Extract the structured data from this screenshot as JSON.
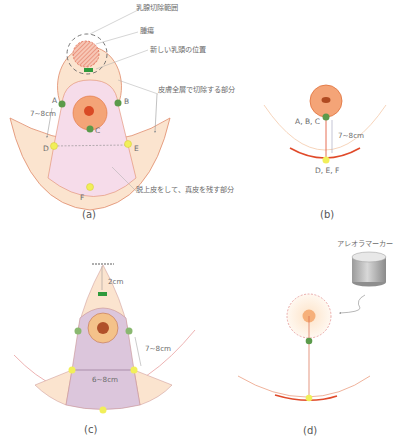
{
  "colors": {
    "skin": "#fbe4cf",
    "skin_stroke": "#e08a6a",
    "pink_region": "#f6dcea",
    "purple_region": "#dcc6dc",
    "areola": "#f4a477",
    "nipple": "#d94a25",
    "green_point": "#5b9a4a",
    "yellow_point": "#f1ef5a",
    "new_nipple_mark": "#2e9a3c",
    "red_line": "#e04a2a",
    "leader_line": "#aaaaaa"
  },
  "panel_a": {
    "caption": "(a)",
    "labels": {
      "mastectomy_range": "乳腺切除範囲",
      "tumor": "腫瘍",
      "new_nipple_position": "新しい乳頭の位置",
      "full_thickness_excision": "皮膚全層で切除する部分",
      "deepithelialized": "脱上皮をして、真皮を残す部分"
    },
    "points": {
      "A": "A",
      "B": "B",
      "C": "C",
      "D": "D",
      "E": "E",
      "F": "F"
    },
    "measure": "7~8cm"
  },
  "panel_b": {
    "caption": "(b)",
    "points_top": "A, B, C",
    "points_bottom": "D, E, F",
    "measure": "7~8cm"
  },
  "panel_c": {
    "caption": "(c)",
    "measure_top": "2cm",
    "measure_side": "7~8cm",
    "measure_width": "6~8cm"
  },
  "panel_d": {
    "caption": "(d)",
    "label_marker": "アレオラマーカー"
  }
}
